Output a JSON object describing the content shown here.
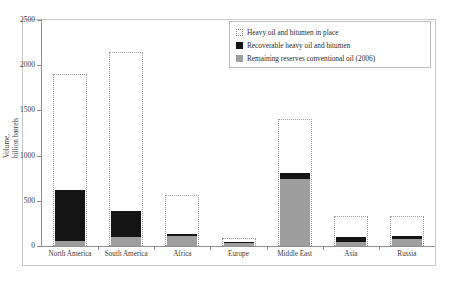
{
  "chart_data": {
    "type": "bar",
    "title": "",
    "xlabel": "",
    "ylabel": "Volume, billion barrels",
    "ylim": [
      0,
      2500
    ],
    "yticks": [
      0,
      500,
      1000,
      1500,
      2000,
      2500
    ],
    "ytick_labels": [
      "0",
      "500",
      "1000",
      "1500",
      "2000",
      "2500"
    ],
    "grid": false,
    "legend_position": "top-right",
    "categories": [
      "North America",
      "South America",
      "Africa",
      "Europe",
      "Middle East",
      "Asia",
      "Russia"
    ],
    "series": [
      {
        "name": "Heavy oil and bitumen in place",
        "style": "dotted-outline",
        "color": "#9a9a9a",
        "values": [
          1900,
          2150,
          560,
          85,
          1400,
          330,
          330
        ]
      },
      {
        "name": "Recoverable heavy oil and bitumen",
        "style": "filled",
        "color": "#151515",
        "values": [
          620,
          390,
          135,
          40,
          805,
          105,
          110
        ]
      },
      {
        "name": "Remaining reserves conventional oil (2006)",
        "style": "filled",
        "color": "#9e9e9e",
        "values": [
          50,
          105,
          110,
          30,
          740,
          45,
          75
        ]
      }
    ]
  },
  "legend": {
    "items": [
      {
        "label": "Heavy oil and bitumen in place",
        "key": "open-dotted-square-icon"
      },
      {
        "label": "Recoverable heavy oil and bitumen",
        "key": "black-square-icon"
      },
      {
        "label": "Remaining reserves conventional oil (2006)",
        "key": "gray-square-icon"
      }
    ]
  },
  "axes": {
    "y_title_line1": "Volume,",
    "y_title_line2": "billion barrels"
  }
}
